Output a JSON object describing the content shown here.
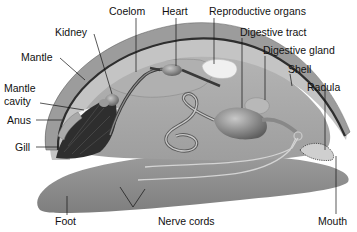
{
  "diagram": {
    "labels": {
      "coelom": "Coelom",
      "heart": "Heart",
      "reproductive_organs": "Reproductive organs",
      "kidney": "Kidney",
      "digestive_tract": "Digestive tract",
      "digestive_gland": "Digestive gland",
      "mantle": "Mantle",
      "shell": "Shell",
      "mantle_cavity_line1": "Mantle",
      "mantle_cavity_line2": "cavity",
      "radula": "Radula",
      "anus": "Anus",
      "gill": "Gill",
      "foot": "Foot",
      "nerve_cords": "Nerve cords",
      "mouth": "Mouth"
    },
    "colors": {
      "shell": "#9a9a9a",
      "shell_edge": "#3a3a3a",
      "mantle": "#b8b8b8",
      "body": "#a4a4a4",
      "foot": "#8a8a8a",
      "gill": "#2e2e2e",
      "organ": "#7a7a7a",
      "repro": "#efefef",
      "leader": "#111111"
    }
  }
}
